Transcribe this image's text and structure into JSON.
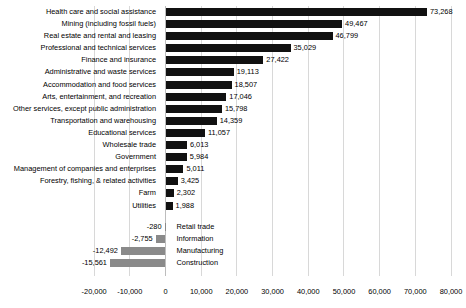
{
  "chart_data": {
    "type": "bar",
    "orientation": "horizontal",
    "title": "",
    "subtitle": "",
    "xlabel": "",
    "ylabel": "",
    "xlim": [
      -20000,
      80000
    ],
    "xtick_step": 10000,
    "xticks": [
      -20000,
      -10000,
      0,
      10000,
      20000,
      30000,
      40000,
      50000,
      60000,
      70000,
      80000
    ],
    "xtick_labels": [
      "-20,000",
      "-10,000",
      "0",
      "10,000",
      "20,000",
      "30,000",
      "40,000",
      "50,000",
      "60,000",
      "70,000",
      "80,000"
    ],
    "grid": true,
    "legend": "none",
    "positive_color": "#111111",
    "negative_color": "#8a8a8a",
    "categories": [
      "Health care and social assistance",
      "Mining (including fossil fuels)",
      "Real estate and rental and leasing",
      "Professional and technical services",
      "Finance and insurance",
      "Administrative and waste services",
      "Accommodation and food services",
      "Arts, entertainment, and recreation",
      "Other services, except public administration",
      "Transportation and warehousing",
      "Educational services",
      "Wholesale trade",
      "Government",
      "Management of companies and enterprises",
      "Forestry, fishing, & related activities",
      "Farm",
      "Utilities",
      "Retail trade",
      "Information",
      "Manufacturing",
      "Construction"
    ],
    "values": [
      73268,
      49467,
      46799,
      35029,
      27422,
      19113,
      18507,
      17046,
      15798,
      14359,
      11057,
      6013,
      5984,
      5011,
      3425,
      2302,
      1988,
      -280,
      -2755,
      -12492,
      -15561
    ],
    "value_labels": [
      "73,268",
      "49,467",
      "46,799",
      "35,029",
      "27,422",
      "19,113",
      "18,507",
      "17,046",
      "15,798",
      "14,359",
      "11,057",
      "6,013",
      "5,984",
      "5,011",
      "3,425",
      "2,302",
      "1,988",
      "-280",
      "-2,755",
      "-12,492",
      "-15,561"
    ]
  }
}
